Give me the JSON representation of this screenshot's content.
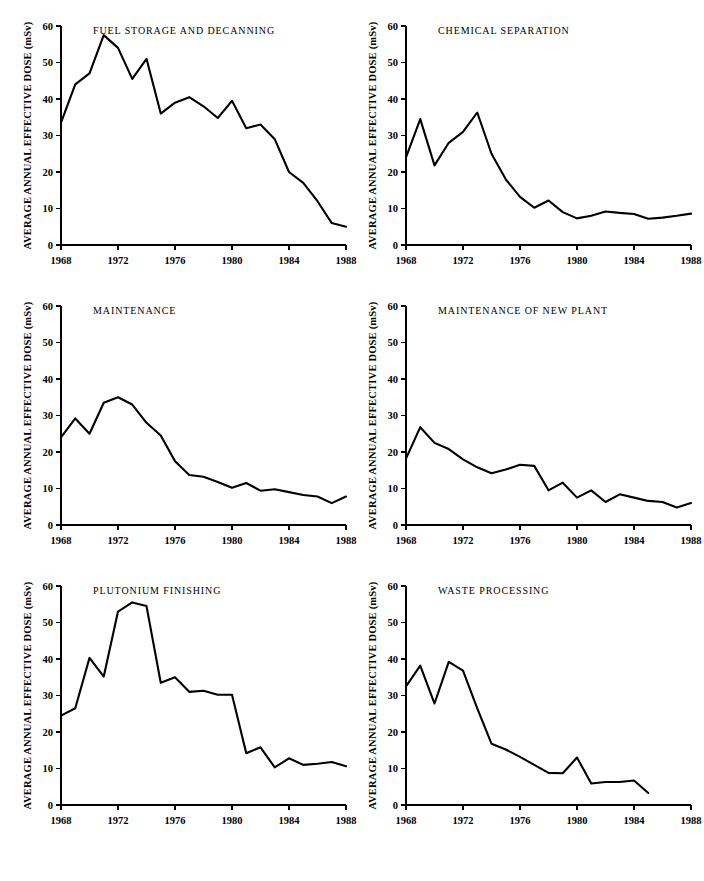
{
  "figure": {
    "background": "#ffffff",
    "ink_color": "#000000",
    "panel_count": 6
  },
  "axis": {
    "ylabel": "AVERAGE ANNUAL EFFECTIVE DOSE (mSv)",
    "xlabel": "",
    "yticks": [
      0,
      10,
      20,
      30,
      40,
      50,
      60
    ],
    "ytick_labels": [
      "0",
      "10",
      "20",
      "30",
      "40",
      "50",
      "60"
    ],
    "xticks": [
      1968,
      1972,
      1976,
      1980,
      1984,
      1988
    ],
    "xtick_labels": [
      "1968",
      "1972",
      "1976",
      "1980",
      "1984",
      "1988"
    ],
    "ylim": [
      0,
      60
    ],
    "xlim": [
      1968,
      1988
    ],
    "grid": false,
    "legend": "none"
  },
  "chart_data": [
    {
      "type": "line",
      "title": "FUEL STORAGE AND DECANNING",
      "xlabel": "",
      "ylabel": "AVERAGE ANNUAL EFFECTIVE DOSE (mSv)",
      "xlim": [
        1968,
        1988
      ],
      "ylim": [
        0,
        60
      ],
      "grid": false,
      "x": [
        1968,
        1969,
        1970,
        1971,
        1972,
        1973,
        1974,
        1975,
        1976,
        1977,
        1978,
        1979,
        1980,
        1981,
        1982,
        1983,
        1984,
        1985,
        1986,
        1987,
        1988
      ],
      "values": [
        33.5,
        44.0,
        47.0,
        57.5,
        54.0,
        45.5,
        51.0,
        36.0,
        39.0,
        40.5,
        38.0,
        34.8,
        39.5,
        32.0,
        33.0,
        29.0,
        20.0,
        17.0,
        12.0,
        6.0,
        5.0
      ]
    },
    {
      "type": "line",
      "title": "CHEMICAL SEPARATION",
      "xlabel": "",
      "ylabel": "AVERAGE ANNUAL EFFECTIVE DOSE (mSv)",
      "xlim": [
        1968,
        1988
      ],
      "ylim": [
        0,
        60
      ],
      "grid": false,
      "x": [
        1968,
        1969,
        1970,
        1971,
        1972,
        1973,
        1974,
        1975,
        1976,
        1977,
        1978,
        1979,
        1980,
        1981,
        1982,
        1983,
        1984,
        1985,
        1986,
        1987,
        1988
      ],
      "values": [
        24.0,
        34.5,
        21.8,
        28.0,
        31.0,
        36.3,
        25.0,
        18.0,
        13.2,
        10.2,
        12.2,
        9.0,
        7.3,
        8.0,
        9.2,
        8.8,
        8.5,
        7.2,
        7.5,
        8.0,
        8.6
      ]
    },
    {
      "type": "line",
      "title": "MAINTENANCE",
      "xlabel": "",
      "ylabel": "AVERAGE ANNUAL EFFECTIVE DOSE (mSv)",
      "xlim": [
        1968,
        1988
      ],
      "ylim": [
        0,
        60
      ],
      "grid": false,
      "x": [
        1968,
        1969,
        1970,
        1971,
        1972,
        1973,
        1974,
        1975,
        1976,
        1977,
        1978,
        1979,
        1980,
        1981,
        1982,
        1983,
        1984,
        1985,
        1986,
        1987,
        1988
      ],
      "values": [
        24.0,
        29.2,
        25.0,
        33.5,
        35.0,
        33.0,
        28.0,
        24.5,
        17.5,
        13.7,
        13.2,
        11.8,
        10.2,
        11.5,
        9.4,
        9.8,
        9.0,
        8.2,
        7.8,
        6.0,
        7.8
      ]
    },
    {
      "type": "line",
      "title": "MAINTENANCE OF NEW PLANT",
      "xlabel": "",
      "ylabel": "AVERAGE ANNUAL EFFECTIVE DOSE (mSv)",
      "xlim": [
        1968,
        1988
      ],
      "ylim": [
        0,
        60
      ],
      "grid": false,
      "x": [
        1968,
        1969,
        1970,
        1971,
        1972,
        1973,
        1974,
        1975,
        1976,
        1977,
        1978,
        1979,
        1980,
        1981,
        1982,
        1983,
        1984,
        1985,
        1986,
        1987,
        1988
      ],
      "values": [
        18.2,
        26.8,
        22.5,
        20.8,
        18.0,
        15.8,
        14.2,
        15.2,
        16.5,
        16.2,
        9.5,
        11.6,
        7.5,
        9.5,
        6.3,
        8.4,
        7.5,
        6.6,
        6.3,
        4.8,
        6.0
      ]
    },
    {
      "type": "line",
      "title": "PLUTONIUM FINISHING",
      "xlabel": "",
      "ylabel": "AVERAGE ANNUAL EFFECTIVE DOSE (mSv)",
      "xlim": [
        1968,
        1988
      ],
      "ylim": [
        0,
        60
      ],
      "grid": false,
      "x": [
        1968,
        1969,
        1970,
        1971,
        1972,
        1973,
        1974,
        1975,
        1976,
        1977,
        1978,
        1979,
        1980,
        1981,
        1982,
        1983,
        1984,
        1985,
        1986,
        1987,
        1988
      ],
      "values": [
        24.5,
        26.5,
        40.3,
        35.2,
        53.0,
        55.5,
        54.5,
        33.5,
        35.0,
        31.0,
        31.3,
        30.2,
        30.2,
        14.2,
        15.8,
        10.3,
        12.8,
        11.0,
        11.3,
        11.8,
        10.6
      ]
    },
    {
      "type": "line",
      "title": "WASTE PROCESSING",
      "xlabel": "",
      "ylabel": "AVERAGE ANNUAL EFFECTIVE DOSE (mSv)",
      "xlim": [
        1968,
        1988
      ],
      "ylim": [
        0,
        60
      ],
      "grid": false,
      "x": [
        1968,
        1969,
        1970,
        1971,
        1972,
        1973,
        1974,
        1975,
        1976,
        1977,
        1978,
        1979,
        1980,
        1981,
        1982,
        1983,
        1984,
        1985
      ],
      "values": [
        32.5,
        38.2,
        27.8,
        39.2,
        36.8,
        26.5,
        16.8,
        15.2,
        13.2,
        11.0,
        8.8,
        8.7,
        13.0,
        5.9,
        6.3,
        6.3,
        6.7,
        3.3
      ]
    }
  ]
}
